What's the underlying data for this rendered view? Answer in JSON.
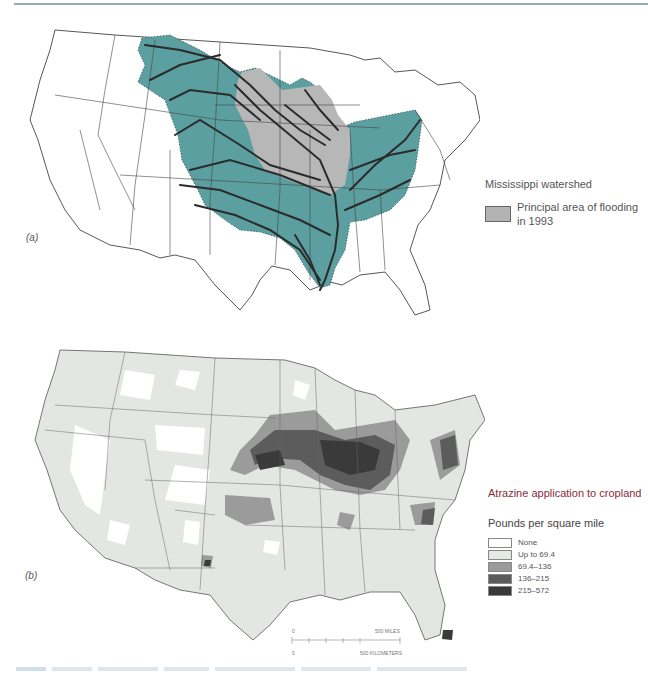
{
  "figure": {
    "panel_a": {
      "label": "(a)",
      "legend_title": "Mississippi watershed",
      "legend_items": [
        {
          "label": "Principal area of flooding in 1993",
          "color": "#b3b3b3"
        }
      ],
      "colors": {
        "watershed": "#5b9fa0",
        "flood_area": "#b7b7b7",
        "rivers": "#2b2b2b",
        "borders": "#444444"
      }
    },
    "panel_b": {
      "label": "(b)",
      "legend_title": "Atrazine application to cropland",
      "legend_subtitle": "Pounds per square mile",
      "legend_items": [
        {
          "label": "None",
          "color": "#ffffff"
        },
        {
          "label": "Up to 69.4",
          "color": "#e6e8e6"
        },
        {
          "label": "69.4–136",
          "color": "#9b9b9b"
        },
        {
          "label": "136–215",
          "color": "#5c5c5c"
        },
        {
          "label": "215–572",
          "color": "#3a3a3a"
        }
      ],
      "scale_bar": {
        "miles_start": "0",
        "miles_end": "500 MILES",
        "km_start": "0",
        "km_end": "500 KILOMETERS"
      }
    }
  }
}
